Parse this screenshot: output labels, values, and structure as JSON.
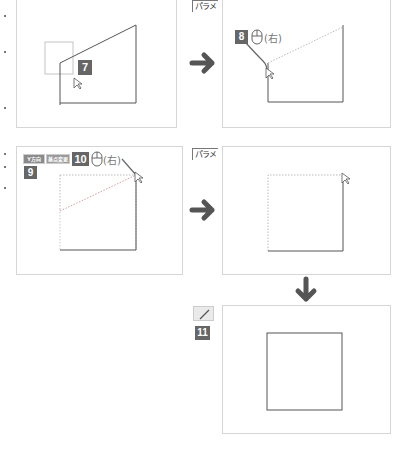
{
  "steps": {
    "step7": {
      "number": "7"
    },
    "step8": {
      "number": "8",
      "mouse_label": "(右)"
    },
    "step9": {
      "number": "9",
      "buttons": [
        "Y方向",
        "基点変更"
      ]
    },
    "step10": {
      "number": "10",
      "mouse_label": "(右)"
    },
    "step11": {
      "number": "11"
    }
  },
  "tabs": {
    "top": "パラメ",
    "middle": "パラメ"
  },
  "icons": {
    "arrow_right_1": "arrow-right-icon",
    "arrow_right_2": "arrow-right-icon",
    "arrow_down": "arrow-down-icon",
    "mouse_8": "mouse-icon",
    "mouse_10": "mouse-icon",
    "line_tool": "line-tool-icon",
    "cursor": "cursor-icon"
  },
  "colors": {
    "badge": "#666666",
    "arrow": "#555555",
    "panel_border": "#d6d6d6",
    "shape_line": "#555555",
    "dotted": "#bbbbbb"
  }
}
